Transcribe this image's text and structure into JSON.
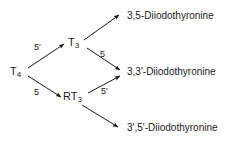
{
  "diagram": {
    "type": "metabolic-pathway",
    "background_color": "#ffffff",
    "line_color": "#1a1a1a",
    "text_color": "#1a1a1a",
    "nodes": [
      {
        "id": "t4",
        "base": "T",
        "subscript": "4",
        "text": "T4"
      },
      {
        "id": "t3",
        "base": "T",
        "subscript": "3",
        "text": "T3"
      },
      {
        "id": "rt3",
        "base": "RT",
        "subscript": "3",
        "text": "RT3"
      }
    ],
    "products": [
      {
        "id": "p35",
        "label": "3,5-Diiodothyronine"
      },
      {
        "id": "p33",
        "label": "3,3'-Diiodothyronine"
      },
      {
        "id": "p3p5p",
        "label": "3',5'-Diiodothyronine"
      }
    ],
    "edges": [
      {
        "id": "t4-t3",
        "from": "T4",
        "to": "T3",
        "enzyme_label": "5'"
      },
      {
        "id": "t4-rt3",
        "from": "T4",
        "to": "RT3",
        "enzyme_label": "5"
      },
      {
        "id": "t3-35",
        "from": "T3",
        "to": "3,5-Diiodothyronine",
        "enzyme_label": ""
      },
      {
        "id": "t3-33",
        "from": "T3",
        "to": "3,3'-Diiodothyronine",
        "enzyme_label": "5"
      },
      {
        "id": "rt3-33",
        "from": "RT3",
        "to": "3,3'-Diiodothyronine",
        "enzyme_label": "5'"
      },
      {
        "id": "rt3-3p5p",
        "from": "RT3",
        "to": "3',5'-Diiodothyronine",
        "enzyme_label": ""
      }
    ]
  }
}
